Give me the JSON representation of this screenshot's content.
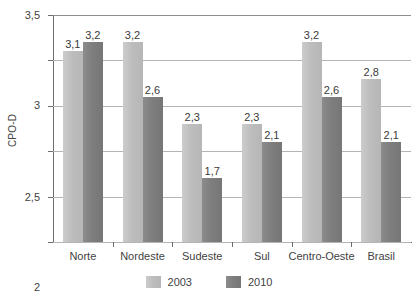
{
  "chart_data": {
    "type": "bar",
    "title": "",
    "subtitle": "",
    "xlabel": "",
    "ylabel": "CPO-D",
    "categories": [
      "Norte",
      "Nordeste",
      "Sudeste",
      "Sul",
      "Centro-Oeste",
      "Brasil"
    ],
    "series": [
      {
        "name": "2003",
        "color": "#bfbfbf",
        "values": [
          3.1,
          3.2,
          2.3,
          2.3,
          3.2,
          2.8
        ],
        "labels": [
          "3,1",
          "3,2",
          "2,3",
          "2,3",
          "3,2",
          "2,8"
        ]
      },
      {
        "name": "2010",
        "color": "#808080",
        "values": [
          3.2,
          2.6,
          1.7,
          2.1,
          2.6,
          2.1
        ],
        "labels": [
          "3,2",
          "2,6",
          "1,7",
          "2,1",
          "2,6",
          "2,1"
        ]
      }
    ],
    "ylim": [
      1,
      3.5
    ],
    "ytick_values": [
      1,
      1.5,
      2,
      2.5,
      3,
      3.5
    ],
    "ytick_labels": [
      "1",
      "1,5",
      "2",
      "2,5",
      "3",
      "3,5"
    ],
    "grid": true,
    "grid_axis": "y",
    "legend_position": "bottom",
    "decimal_separator": ","
  }
}
